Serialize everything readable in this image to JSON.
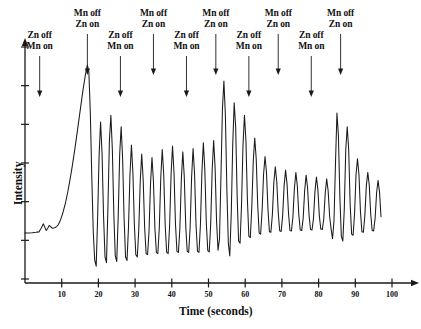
{
  "chart_data": {
    "type": "line",
    "title": "",
    "xlabel": "Time (seconds)",
    "ylabel": "Intensity",
    "xlim": [
      0,
      103
    ],
    "ylim": [
      0,
      1
    ],
    "grid": false,
    "legend": "none",
    "xticks": [
      10,
      20,
      30,
      40,
      50,
      60,
      70,
      80,
      90,
      100
    ],
    "xtick_labels": [
      "10",
      "20",
      "30",
      "40",
      "50",
      "60",
      "70",
      "80",
      "90",
      "100"
    ],
    "ytick_count": 7,
    "ytick_labels": [],
    "series_name": "Intensity trace",
    "line_color": "#1a1a1a",
    "axis_color": "#1a1a1a",
    "annotations": [
      {
        "id": "a1",
        "time": 4,
        "label_line1": "Zn off",
        "label_line2": "Mn on",
        "row": "lower"
      },
      {
        "id": "a2",
        "time": 17,
        "label_line1": "Mn off",
        "label_line2": "Zn on",
        "row": "upper"
      },
      {
        "id": "a3",
        "time": 26,
        "label_line1": "Zn off",
        "label_line2": "Mn on",
        "row": "lower"
      },
      {
        "id": "a4",
        "time": 35,
        "label_line1": "Mn off",
        "label_line2": "Zn on",
        "row": "upper"
      },
      {
        "id": "a5",
        "time": 44,
        "label_line1": "Zn off",
        "label_line2": "Mn on",
        "row": "lower"
      },
      {
        "id": "a6",
        "time": 52,
        "label_line1": "Mn off",
        "label_line2": "Zn on",
        "row": "upper"
      },
      {
        "id": "a7",
        "time": 61,
        "label_line1": "Zn off",
        "label_line2": "Mn on",
        "row": "lower"
      },
      {
        "id": "a8",
        "time": 69,
        "label_line1": "Mn off",
        "label_line2": "Zn on",
        "row": "upper"
      },
      {
        "id": "a9",
        "time": 78,
        "label_line1": "Zn off",
        "label_line2": "Mn on",
        "row": "lower"
      },
      {
        "id": "a10",
        "time": 86,
        "label_line1": "Mn off",
        "label_line2": "Zn on",
        "row": "upper"
      }
    ],
    "x": [
      0.0,
      1.0,
      2.0,
      3.0,
      3.8,
      4.4,
      5.0,
      5.4,
      5.8,
      6.2,
      6.6,
      7.0,
      7.4,
      7.8,
      8.2,
      8.6,
      9.0,
      9.4,
      9.8,
      10.4,
      11.0,
      11.6,
      12.2,
      12.8,
      13.4,
      14.0,
      14.6,
      15.2,
      15.8,
      16.4,
      17.0,
      17.4,
      17.8,
      18.2,
      18.6,
      19.0,
      19.4,
      19.8,
      20.2,
      20.6,
      21.0,
      21.4,
      21.8,
      22.2,
      22.6,
      23.0,
      23.4,
      23.8,
      24.2,
      24.6,
      25.0,
      25.4,
      25.8,
      26.2,
      26.6,
      27.0,
      27.4,
      27.8,
      28.2,
      28.6,
      29.0,
      29.4,
      29.8,
      30.2,
      30.6,
      31.0,
      31.4,
      31.8,
      32.2,
      32.6,
      33.0,
      33.4,
      33.8,
      34.2,
      34.6,
      35.0,
      35.4,
      35.8,
      36.2,
      36.6,
      37.0,
      37.4,
      37.8,
      38.2,
      38.6,
      39.0,
      39.4,
      39.8,
      40.2,
      40.6,
      41.0,
      41.4,
      41.8,
      42.2,
      42.6,
      43.0,
      43.4,
      43.8,
      44.2,
      44.6,
      45.0,
      45.4,
      45.8,
      46.2,
      46.6,
      47.0,
      47.4,
      47.8,
      48.2,
      48.6,
      49.0,
      49.4,
      49.8,
      50.2,
      50.6,
      51.0,
      51.4,
      51.8,
      52.2,
      52.6,
      53.0,
      53.4,
      53.8,
      54.2,
      54.6,
      55.0,
      55.4,
      55.8,
      56.2,
      56.6,
      57.0,
      57.4,
      57.8,
      58.2,
      58.6,
      59.0,
      59.4,
      59.8,
      60.2,
      60.6,
      61.0,
      61.4,
      61.8,
      62.2,
      62.6,
      63.0,
      63.4,
      63.8,
      64.2,
      64.6,
      65.0,
      65.4,
      65.8,
      66.2,
      66.6,
      67.0,
      67.4,
      67.8,
      68.2,
      68.6,
      69.0,
      69.4,
      69.8,
      70.2,
      70.6,
      71.0,
      71.4,
      71.8,
      72.2,
      72.6,
      73.0,
      73.4,
      73.8,
      74.2,
      74.6,
      75.0,
      75.4,
      75.8,
      76.2,
      76.6,
      77.0,
      77.4,
      77.8,
      78.2,
      78.6,
      79.0,
      79.4,
      79.8,
      80.2,
      80.6,
      81.0,
      81.4,
      81.8,
      82.2,
      82.6,
      83.0,
      83.4,
      83.8,
      84.2,
      84.6,
      85.0,
      85.4,
      85.8,
      86.2,
      86.6,
      87.0,
      87.4,
      87.8,
      88.2,
      88.6,
      89.0,
      89.4,
      89.8,
      90.2,
      90.6,
      91.0,
      91.4,
      91.8,
      92.2,
      92.6,
      93.0,
      93.4,
      93.8,
      94.2,
      94.6,
      95.0,
      95.4,
      95.8,
      96.2,
      96.6,
      97.0
    ],
    "y": [
      0.175,
      0.175,
      0.176,
      0.178,
      0.18,
      0.196,
      0.215,
      0.2,
      0.186,
      0.196,
      0.208,
      0.203,
      0.196,
      0.197,
      0.199,
      0.203,
      0.21,
      0.222,
      0.238,
      0.268,
      0.305,
      0.35,
      0.402,
      0.46,
      0.522,
      0.59,
      0.66,
      0.73,
      0.8,
      0.862,
      0.91,
      0.88,
      0.7,
      0.42,
      0.18,
      0.055,
      0.03,
      0.25,
      0.52,
      0.66,
      0.52,
      0.25,
      0.07,
      0.045,
      0.29,
      0.58,
      0.69,
      0.54,
      0.26,
      0.075,
      0.05,
      0.25,
      0.52,
      0.64,
      0.5,
      0.24,
      0.07,
      0.055,
      0.2,
      0.43,
      0.56,
      0.44,
      0.21,
      0.08,
      0.07,
      0.19,
      0.4,
      0.52,
      0.41,
      0.2,
      0.085,
      0.08,
      0.185,
      0.39,
      0.505,
      0.4,
      0.195,
      0.09,
      0.085,
      0.2,
      0.42,
      0.54,
      0.43,
      0.21,
      0.09,
      0.085,
      0.205,
      0.43,
      0.555,
      0.44,
      0.215,
      0.095,
      0.09,
      0.195,
      0.41,
      0.53,
      0.42,
      0.205,
      0.095,
      0.09,
      0.2,
      0.42,
      0.545,
      0.435,
      0.21,
      0.095,
      0.09,
      0.21,
      0.44,
      0.57,
      0.45,
      0.22,
      0.098,
      0.092,
      0.215,
      0.45,
      0.58,
      0.46,
      0.225,
      0.1,
      0.15,
      0.43,
      0.72,
      0.84,
      0.69,
      0.37,
      0.13,
      0.075,
      0.26,
      0.56,
      0.745,
      0.64,
      0.34,
      0.14,
      0.13,
      0.3,
      0.56,
      0.69,
      0.58,
      0.32,
      0.16,
      0.155,
      0.29,
      0.49,
      0.59,
      0.5,
      0.3,
      0.175,
      0.17,
      0.27,
      0.43,
      0.51,
      0.44,
      0.28,
      0.18,
      0.178,
      0.255,
      0.395,
      0.465,
      0.4,
      0.265,
      0.185,
      0.182,
      0.25,
      0.38,
      0.45,
      0.39,
      0.26,
      0.186,
      0.184,
      0.245,
      0.37,
      0.44,
      0.382,
      0.256,
      0.188,
      0.186,
      0.24,
      0.36,
      0.428,
      0.372,
      0.252,
      0.19,
      0.188,
      0.238,
      0.355,
      0.42,
      0.366,
      0.25,
      0.192,
      0.19,
      0.235,
      0.348,
      0.412,
      0.36,
      0.248,
      0.193,
      0.15,
      0.23,
      0.48,
      0.7,
      0.6,
      0.33,
      0.16,
      0.14,
      0.28,
      0.54,
      0.64,
      0.54,
      0.3,
      0.17,
      0.165,
      0.26,
      0.43,
      0.5,
      0.43,
      0.27,
      0.18,
      0.178,
      0.25,
      0.38,
      0.44,
      0.385,
      0.258,
      0.186,
      0.184,
      0.24,
      0.35,
      0.405,
      0.355,
      0.246,
      0.192,
      0.19,
      0.232,
      0.32,
      0.368,
      0.33,
      0.24,
      0.2,
      0.198,
      0.218,
      0.24,
      0.238,
      0.222
    ]
  }
}
